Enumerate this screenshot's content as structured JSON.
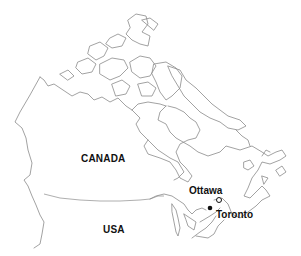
{
  "map": {
    "colors": {
      "outline": "#8a8a8a",
      "text": "#111111",
      "background": "#ffffff"
    },
    "labels": {
      "canada": "CANADA",
      "usa": "USA",
      "ottawa": "Ottawa",
      "toronto": "Toronto"
    },
    "markers": [
      {
        "name": "Ottawa",
        "type": "capital-open-circle"
      },
      {
        "name": "Toronto",
        "type": "city-filled-dot"
      }
    ]
  }
}
